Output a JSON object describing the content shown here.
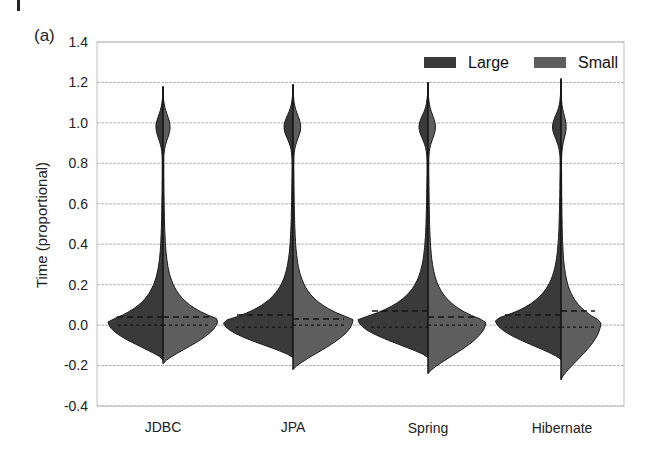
{
  "panel_label": "(a)",
  "colors": {
    "large": "#3a3a3a",
    "small": "#5e5e5e",
    "grid": "#b5b5b5",
    "axis": "#a0a0a0"
  },
  "chart_data": {
    "type": "violin",
    "subtype": "split violin",
    "title": "",
    "panel": "(a)",
    "xlabel": "",
    "ylabel": "Time (proportional)",
    "ylim": [
      -0.4,
      1.4
    ],
    "yticks": [
      "1.4",
      "1.2",
      "1.0",
      "0.8",
      "0.6",
      "0.4",
      "0.2",
      "0.0",
      "-0.2",
      "-0.4"
    ],
    "categories": [
      "JDBC",
      "JPA",
      "Spring",
      "Hibernate"
    ],
    "grid": true,
    "legend": {
      "position": "top-right",
      "entries": [
        "Large",
        "Small"
      ]
    },
    "series": [
      {
        "name": "Large",
        "side": "left",
        "min": [
          -0.17,
          -0.16,
          -0.16,
          -0.17
        ],
        "max": [
          1.18,
          1.19,
          1.2,
          1.21
        ],
        "median": [
          0.0,
          -0.01,
          -0.01,
          -0.01
        ],
        "quartile_upper": [
          0.04,
          0.05,
          0.07,
          0.05
        ],
        "quartile_lower": [
          -0.01,
          -0.01,
          -0.01,
          -0.01
        ],
        "mode": [
          0.02,
          0.02,
          0.03,
          0.03
        ]
      },
      {
        "name": "Small",
        "side": "right",
        "min": [
          -0.19,
          -0.22,
          -0.24,
          -0.27
        ],
        "max": [
          1.18,
          1.19,
          1.2,
          1.22
        ],
        "median": [
          0.0,
          0.0,
          0.0,
          -0.01
        ],
        "quartile_upper": [
          0.04,
          0.03,
          0.04,
          0.07
        ],
        "quartile_lower": [
          -0.01,
          -0.01,
          -0.01,
          -0.01
        ],
        "mode": [
          0.03,
          0.03,
          0.02,
          0.02
        ]
      }
    ]
  }
}
